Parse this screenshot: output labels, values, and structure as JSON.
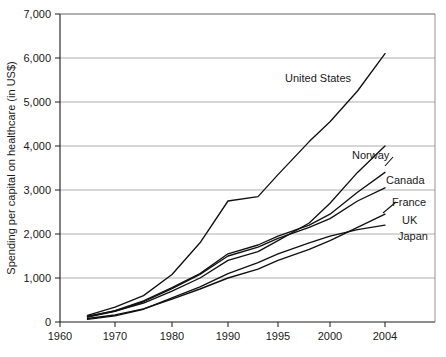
{
  "chart_data": {
    "type": "line",
    "title": "",
    "subtitle": "",
    "xlabel": "",
    "ylabel": "Spending per capital on healthcare (in US$)",
    "xlim": [
      1960,
      2007
    ],
    "ylim": [
      0,
      7000
    ],
    "grid": true,
    "legend_position": "inline-right-labels",
    "x_ticks": [
      1960,
      1970,
      1980,
      1990,
      1995,
      2000,
      2004
    ],
    "x_tick_labels": [
      "1960",
      "1970",
      "1980",
      "1990",
      "1995",
      "2000",
      "2004"
    ],
    "y_ticks": [
      0,
      1000,
      2000,
      3000,
      4000,
      5000,
      6000,
      7000
    ],
    "y_tick_labels": [
      "0",
      "1,000",
      "2,000",
      "3,000",
      "4,000",
      "5,000",
      "6,000",
      "7,000"
    ],
    "x": [
      1965,
      1970,
      1975,
      1980,
      1985,
      1990,
      1993,
      1995,
      1998,
      2000,
      2002,
      2004
    ],
    "series": [
      {
        "name": "United States",
        "label": "United States",
        "values": [
          150,
          340,
          600,
          1080,
          1800,
          2750,
          2850,
          3350,
          4100,
          4550,
          5250,
          6100
        ]
      },
      {
        "name": "Norway",
        "label": "Norway",
        "values": [
          130,
          250,
          430,
          700,
          1000,
          1400,
          1600,
          1850,
          2250,
          2700,
          3400,
          4000
        ]
      },
      {
        "name": "Canada",
        "label": "Canada",
        "values": [
          120,
          260,
          480,
          780,
          1100,
          1550,
          1750,
          1950,
          2200,
          2450,
          2950,
          3400
        ]
      },
      {
        "name": "France",
        "label": "France",
        "values": [
          110,
          240,
          460,
          760,
          1080,
          1500,
          1700,
          1900,
          2150,
          2350,
          2750,
          3050
        ]
      },
      {
        "name": "UK",
        "label": "UK",
        "values": [
          80,
          160,
          300,
          520,
          750,
          1000,
          1200,
          1400,
          1650,
          1850,
          2150,
          2450
        ]
      },
      {
        "name": "Japan",
        "label": "Japan",
        "values": [
          60,
          140,
          290,
          550,
          800,
          1100,
          1350,
          1550,
          1800,
          1950,
          2100,
          2200
        ]
      }
    ],
    "annotations": [
      {
        "text": "United States",
        "x_px": 285,
        "y_px": 82
      },
      {
        "text": "Norway",
        "x_px": 352,
        "y_px": 159
      },
      {
        "text": "Canada",
        "x_px": 386,
        "y_px": 184
      },
      {
        "text": "France",
        "x_px": 392,
        "y_px": 206
      },
      {
        "text": "UK",
        "x_px": 402,
        "y_px": 224
      },
      {
        "text": "Japan",
        "x_px": 398,
        "y_px": 240
      }
    ]
  },
  "colors": {
    "line": "#111111",
    "grid": "#9a9a9a",
    "axis": "#1a1a1a",
    "background": "#ffffff"
  }
}
